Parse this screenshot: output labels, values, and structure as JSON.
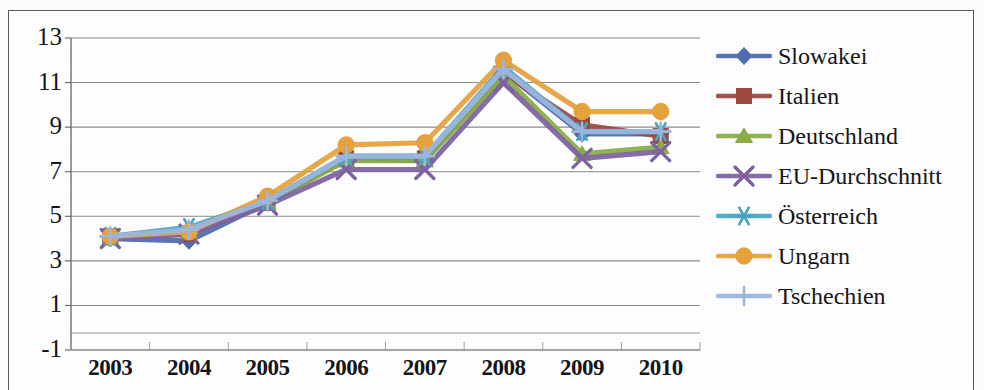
{
  "chart_data": {
    "type": "line",
    "title": "",
    "subtitle": "",
    "xlabel": "",
    "ylabel": "",
    "categories": [
      "2003",
      "2004",
      "2005",
      "2006",
      "2007",
      "2008",
      "2009",
      "2010"
    ],
    "ylim": [
      -1,
      13
    ],
    "yticks": [
      "13",
      "11",
      "9",
      "7",
      "5",
      "3",
      "1",
      "-1"
    ],
    "ytick_values": [
      13,
      11,
      9,
      7,
      5,
      3,
      1,
      -1
    ],
    "grid": true,
    "grid_axis": "y",
    "legend_position": "right",
    "series": [
      {
        "name": "Slowakei",
        "color": "#4f6cb0",
        "marker": "diamond",
        "values": [
          4.0,
          3.9,
          5.6,
          7.6,
          7.5,
          11.5,
          8.7,
          8.7
        ]
      },
      {
        "name": "Italien",
        "color": "#9d4a41",
        "marker": "square",
        "values": [
          4.1,
          4.2,
          5.6,
          7.6,
          7.6,
          11.4,
          9.1,
          8.6
        ]
      },
      {
        "name": "Deutschland",
        "color": "#8aad45",
        "marker": "triangle",
        "values": [
          4.0,
          4.3,
          5.6,
          7.5,
          7.5,
          11.3,
          7.8,
          8.1
        ]
      },
      {
        "name": "EU-Durchschnitt",
        "color": "#7f63a1",
        "marker": "cross",
        "values": [
          4.0,
          4.2,
          5.5,
          7.1,
          7.1,
          11.0,
          7.6,
          7.9
        ]
      },
      {
        "name": "Österreich",
        "color": "#49a8c4",
        "marker": "asterisk",
        "values": [
          4.1,
          4.5,
          5.7,
          7.7,
          7.7,
          11.7,
          8.8,
          8.8
        ]
      },
      {
        "name": "Ungarn",
        "color": "#e7a33c",
        "marker": "circle",
        "values": [
          4.1,
          4.3,
          5.9,
          8.2,
          8.3,
          12.0,
          9.7,
          9.7
        ]
      },
      {
        "name": "Tschechien",
        "color": "#9cb7e2",
        "marker": "plus",
        "values": [
          4.1,
          4.4,
          5.7,
          7.7,
          7.7,
          11.6,
          8.8,
          8.8
        ]
      }
    ]
  },
  "legend": {
    "items": [
      {
        "label": "Slowakei"
      },
      {
        "label": "Italien"
      },
      {
        "label": "Deutschland"
      },
      {
        "label": "EU-Durchschnitt"
      },
      {
        "label": "Österreich"
      },
      {
        "label": "Ungarn"
      },
      {
        "label": "Tschechien"
      }
    ]
  }
}
